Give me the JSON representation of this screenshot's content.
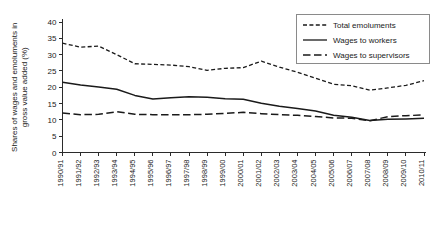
{
  "chart_data": {
    "type": "line",
    "title": "",
    "xlabel": "",
    "ylabel": "Shares of wages and emoluments in gross value added (%)",
    "ylabel_line1": "Shares of wages and emoluments in",
    "ylabel_line2": "gross value added (%)",
    "ylim": [
      0,
      40
    ],
    "yticks": [
      0,
      5,
      10,
      15,
      20,
      25,
      30,
      35,
      40
    ],
    "ytick_labels": [
      "0",
      "5",
      "10",
      "15",
      "20",
      "25",
      "30",
      "35",
      "40"
    ],
    "grid": false,
    "legend_position": "top-right",
    "categories": [
      "1990/91",
      "1991/92",
      "1992/93",
      "1993/94",
      "1994/95",
      "1995/96",
      "1996/97",
      "1997/98",
      "1998/99",
      "1999/00",
      "2000/01",
      "2001/02",
      "2002/03",
      "2003/04",
      "2004/05",
      "2005/06",
      "2006/07",
      "2007/08",
      "2008/09",
      "2009/10",
      "2010/11"
    ],
    "series": [
      {
        "name": "Total emoluments",
        "style": "dashed",
        "values": [
          33.5,
          32.3,
          32.6,
          30.0,
          27.2,
          27.0,
          26.8,
          26.3,
          25.2,
          25.8,
          26.0,
          28.0,
          26.2,
          24.6,
          22.8,
          20.9,
          20.5,
          19.1,
          19.8,
          20.6,
          22.0
        ]
      },
      {
        "name": "Wages to workers",
        "style": "solid",
        "values": [
          21.5,
          20.7,
          20.1,
          19.4,
          17.5,
          16.4,
          16.8,
          17.1,
          16.9,
          16.5,
          16.3,
          15.1,
          14.2,
          13.5,
          12.7,
          11.4,
          10.8,
          9.8,
          10.2,
          10.3,
          10.5
        ]
      },
      {
        "name": "Wages to supervisors",
        "style": "longdash",
        "values": [
          12.1,
          11.6,
          11.7,
          12.5,
          11.7,
          11.6,
          11.6,
          11.6,
          11.7,
          12.0,
          12.3,
          11.9,
          11.6,
          11.4,
          11.0,
          10.6,
          10.5,
          9.7,
          11.0,
          11.3,
          11.5
        ]
      }
    ]
  },
  "legend": {
    "items": [
      {
        "label": "Total emoluments",
        "style": "dashed"
      },
      {
        "label": "Wages to workers",
        "style": "solid"
      },
      {
        "label": "Wages to supervisors",
        "style": "longdash"
      }
    ]
  },
  "colors": {
    "line": "#1a1a1a",
    "axis": "#2b2b2b",
    "legend_border": "#8a8a8a",
    "background": "#ffffff"
  }
}
